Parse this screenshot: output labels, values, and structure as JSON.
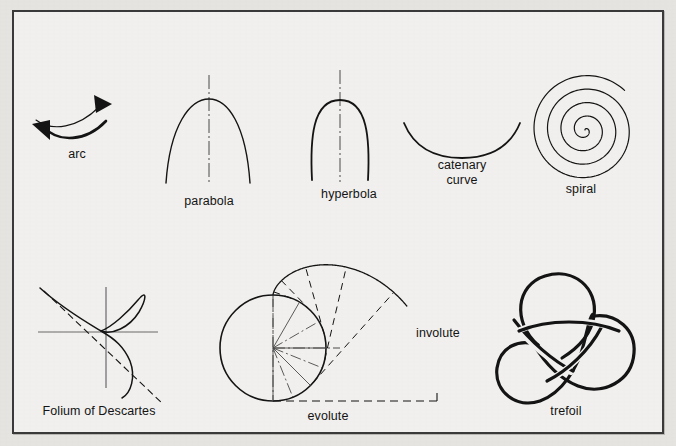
{
  "figure": {
    "background_color": "#e6e5e2",
    "plate_color": "#f2f1ef",
    "border_color": "#3a3a3a",
    "ink_color": "#141414"
  },
  "labels": {
    "arc": "arc",
    "parabola": "parabola",
    "hyperbola": "hyperbola",
    "catenary_line1": "catenary",
    "catenary_line2": "curve",
    "spiral": "spiral",
    "folium": "Folium of Descartes",
    "evolute": "evolute",
    "involute": "involute",
    "trefoil": "trefoil"
  },
  "items": [
    {
      "name": "arc",
      "label": "arc",
      "row": 1,
      "col": 1
    },
    {
      "name": "parabola",
      "label": "parabola",
      "row": 1,
      "col": 2
    },
    {
      "name": "hyperbola",
      "label": "hyperbola",
      "row": 1,
      "col": 3
    },
    {
      "name": "catenary",
      "label": "catenary curve",
      "row": 1,
      "col": 4
    },
    {
      "name": "spiral",
      "label": "spiral",
      "row": 1,
      "col": 5
    },
    {
      "name": "folium",
      "label": "Folium of Descartes",
      "row": 2,
      "col": 1
    },
    {
      "name": "evolute",
      "label": "evolute",
      "row": 2,
      "col": 2
    },
    {
      "name": "involute",
      "label": "involute",
      "row": 2,
      "col": 2
    },
    {
      "name": "trefoil",
      "label": "trefoil",
      "row": 2,
      "col": 3
    }
  ]
}
